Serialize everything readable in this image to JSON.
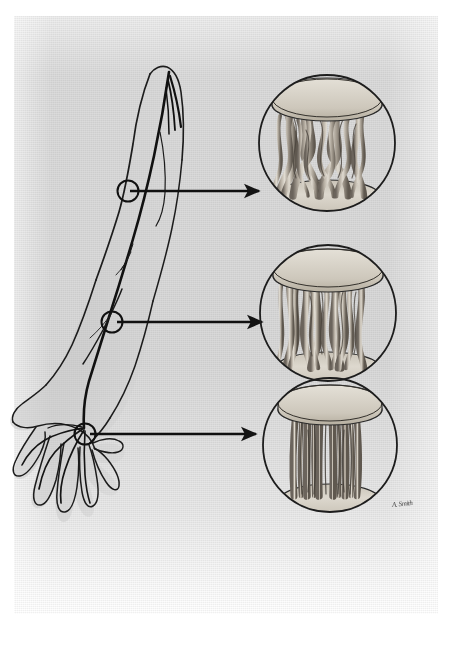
{
  "figure": {
    "title": "Topographical fascicular structure of a peripheral nerve at three levels of the upper limb",
    "medium": "graphite and wash anatomical illustration on textured paper",
    "background_color": "#d9d9d9",
    "ink_color": "#1a1a1a",
    "page_color": "#ffffff",
    "signature": "A. Smith"
  },
  "limb": {
    "name": "right-upper-limb",
    "description": "Anterior view of an outstretched arm, forearm and hand with the course of a major peripheral nerve and its branches drawn in dark ink",
    "nerve_label": "peripheral-nerve-trunk",
    "markers": [
      {
        "id": "level-1",
        "label": "upper arm level",
        "x": 128,
        "y": 191,
        "r": 11
      },
      {
        "id": "level-2",
        "label": "proximal forearm level",
        "x": 112,
        "y": 322,
        "r": 11
      },
      {
        "id": "level-3",
        "label": "wrist level",
        "x": 85,
        "y": 434,
        "r": 11
      }
    ]
  },
  "arrows": [
    {
      "id": "arrow-1",
      "from_x": 130,
      "from_y": 191,
      "to_x": 262,
      "to_y": 191
    },
    {
      "id": "arrow-2",
      "from_x": 117,
      "from_y": 322,
      "to_x": 265,
      "to_y": 322
    },
    {
      "id": "arrow-3",
      "from_x": 90,
      "from_y": 434,
      "to_x": 259,
      "to_y": 434
    }
  ],
  "insets": [
    {
      "id": "inset-proximal",
      "level": "level-1",
      "cx": 327,
      "cy": 143,
      "r": 69,
      "caption": "Proximal nerve segment — richly plexiform fascicular interchange",
      "plexus": "dense",
      "fascicle_count": 14
    },
    {
      "id": "inset-middle",
      "level": "level-2",
      "cx": 328,
      "cy": 313,
      "r": 69,
      "caption": "Mid-forearm nerve segment — moderate fascicular interweaving",
      "plexus": "moderate",
      "fascicle_count": 12
    },
    {
      "id": "inset-distal",
      "level": "level-3",
      "cx": 330,
      "cy": 445,
      "r": 68,
      "caption": "Distal nerve segment at the wrist — nearly parallel, minimally interconnected fascicles",
      "plexus": "minimal",
      "fascicle_count": 11
    }
  ],
  "colors": {
    "paper": "#d9d9d9",
    "ink": "#1a1a1a",
    "fascicle_light": "#cfc9bf",
    "fascicle_mid": "#a79f93",
    "fascicle_dark": "#6f6860",
    "disc_top": "#d6d1c6",
    "disc_shadow": "#56504a"
  }
}
